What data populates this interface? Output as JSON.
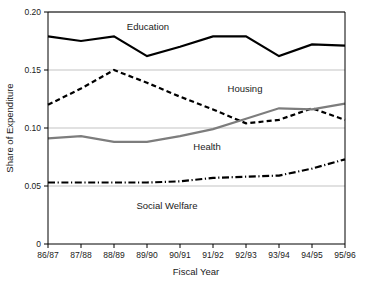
{
  "chart_data": {
    "type": "line",
    "title": "",
    "xlabel": "Fiscal Year",
    "ylabel": "Share of Expenditure",
    "categories": [
      "86/87",
      "87/88",
      "88/89",
      "89/90",
      "90/91",
      "91/92",
      "92/93",
      "93/94",
      "94/95",
      "95/96"
    ],
    "ylim": [
      0,
      0.2
    ],
    "yticks": [
      0,
      0.05,
      0.1,
      0.15,
      0.2
    ],
    "ytick_labels": [
      "0",
      "0.05",
      "0.10",
      "0.15",
      "0.20"
    ],
    "grid": true,
    "grid_axis": "y",
    "legend": "inline-annotations",
    "series": [
      {
        "name": "Education",
        "style": "solid",
        "color": "#000000",
        "width": 2.2,
        "label_x": "88/89",
        "values": [
          0.179,
          0.175,
          0.179,
          0.162,
          0.17,
          0.179,
          0.179,
          0.162,
          0.172,
          0.171
        ]
      },
      {
        "name": "Housing",
        "style": "dashed",
        "color": "#000000",
        "width": 2.2,
        "label_x": "91/92",
        "values": [
          0.12,
          0.134,
          0.15,
          0.139,
          0.127,
          0.116,
          0.104,
          0.107,
          0.117,
          0.107
        ]
      },
      {
        "name": "Health",
        "style": "solid",
        "color": "#7d7d7d",
        "width": 2.2,
        "label_x": "90/91",
        "values": [
          0.091,
          0.093,
          0.088,
          0.088,
          0.093,
          0.099,
          0.108,
          0.117,
          0.116,
          0.121
        ]
      },
      {
        "name": "Social Welfare",
        "style": "dashdot",
        "color": "#000000",
        "width": 2.2,
        "label_x": "88/89",
        "values": [
          0.053,
          0.053,
          0.053,
          0.053,
          0.054,
          0.057,
          0.058,
          0.059,
          0.065,
          0.073
        ]
      }
    ]
  },
  "annotations": {
    "education": "Education",
    "housing": "Housing",
    "health": "Health",
    "social_welfare": "Social Welfare"
  },
  "axes": {
    "y_title": "Share of Expenditure",
    "x_title": "Fiscal Year"
  }
}
